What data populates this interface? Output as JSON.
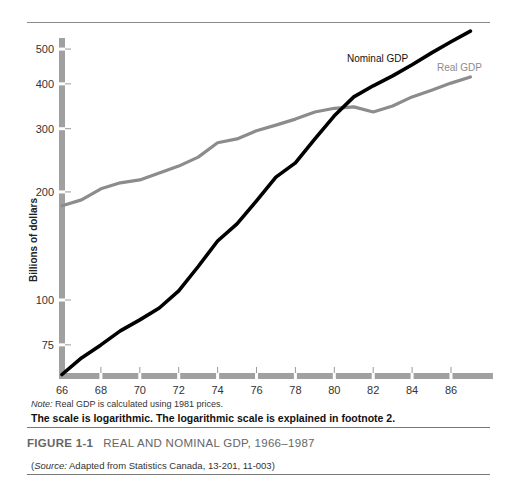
{
  "figure": {
    "number": "FIGURE 1-1",
    "title": "REAL AND NOMINAL GDP, 1966–1987",
    "note_prefix": "Note:",
    "note_text": " Real GDP is calculated using 1981 prices.",
    "scale_note": "The scale is logarithmic. The logarithmic scale is explained in footnote 2.",
    "source_open": "(",
    "source_prefix": "Source:",
    "source_text": " Adapted from Statistics Canada, 13-201, 11-003)"
  },
  "colors": {
    "nominal": "#000000",
    "real": "#8c8c8c",
    "axis": "#a0a0a0"
  },
  "chart_data": {
    "type": "line",
    "title": "Real and Nominal GDP, 1966–1987",
    "xlabel": "",
    "ylabel": "Billions of dollars",
    "yscale": "log",
    "ylim": [
      62,
      560
    ],
    "xlim": [
      1966,
      1987
    ],
    "y_ticks": [
      75,
      100,
      200,
      300,
      400,
      500
    ],
    "x_ticks": [
      "66",
      "68",
      "70",
      "72",
      "74",
      "76",
      "78",
      "80",
      "82",
      "84",
      "86"
    ],
    "grid": false,
    "legend": "inline labels near line ends",
    "x": [
      1966,
      1967,
      1968,
      1969,
      1970,
      1971,
      1972,
      1973,
      1974,
      1975,
      1976,
      1977,
      1978,
      1979,
      1980,
      1981,
      1982,
      1983,
      1984,
      1985,
      1986,
      1987
    ],
    "series": [
      {
        "name": "Nominal GDP",
        "values": [
          62,
          69,
          75,
          82,
          88,
          95,
          106,
          124,
          146,
          163,
          189,
          220,
          241,
          281,
          326,
          368,
          395,
          421,
          452,
          488,
          524,
          561
        ]
      },
      {
        "name": "Real GDP",
        "values": [
          183,
          190,
          204,
          212,
          216,
          226,
          236,
          250,
          274,
          281,
          296,
          307,
          319,
          334,
          342,
          345,
          334,
          347,
          368,
          384,
          402,
          418
        ]
      }
    ]
  }
}
